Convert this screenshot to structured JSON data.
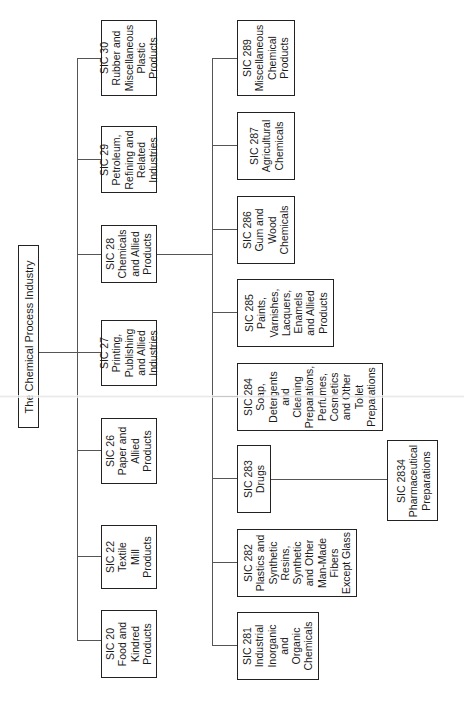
{
  "title": "The Chemical Process Industry",
  "level1": [
    {
      "code": "SIC 30",
      "label": "SIC 30\nRubber and\nMiscellaneous\nPlastic\nProducts"
    },
    {
      "code": "SIC 29",
      "label": "SIC 29\nPetroleum,\nRefining and\nRelated\nIndustries"
    },
    {
      "code": "SIC 28",
      "label": "SIC 28\nChemicals\nand Allied\nProducts"
    },
    {
      "code": "SIC 27",
      "label": "SIC 27\nPrinting,\nPublishing\nand Allied\nIndustries"
    },
    {
      "code": "SIC 26",
      "label": "SIC 26\nPaper and\nAllied\nProducts"
    },
    {
      "code": "SIC 22",
      "label": "SIC 22\nTextile\nMill\nProducts"
    },
    {
      "code": "SIC 20",
      "label": "SIC 20\nFood and\nKindred\nProducts"
    }
  ],
  "level2": [
    {
      "code": "SIC 289",
      "label": "SIC 289\nMiscellaneous\nChemical\nProducts"
    },
    {
      "code": "SIC 287",
      "label": "SIC 287\nAgricultural\nChemicals"
    },
    {
      "code": "SIC 286",
      "label": "SIC 286\nGum and\nWood\nChemicals"
    },
    {
      "code": "SIC 285",
      "label": "SIC 285\nPaints,\nVarnishes,\nLacquers,\nEnamels\nand Allied\nProducts"
    },
    {
      "code": "SIC 284",
      "label": "SIC 284\nSoap,\nDetergents\nand\nCleaning\nPreparations,\nPerfumes,\nCosmetics\nand Other\nToilet\nPreparations"
    },
    {
      "code": "SIC 283",
      "label": "SIC 283\nDrugs"
    },
    {
      "code": "SIC 282",
      "label": "SIC 282\nPlastics and\nSynthetic\nResins,\nSynthetic\nand Other\nMan-Made\nFibers\nExcept Glass"
    },
    {
      "code": "SIC 281",
      "label": "SIC 281\nIndustrial\nInorganic\nand\nOrganic\nChemicals"
    }
  ],
  "level3": [
    {
      "code": "SIC 2834",
      "label": "SIC 2834\nPharmaceutical\nPreparations"
    }
  ]
}
